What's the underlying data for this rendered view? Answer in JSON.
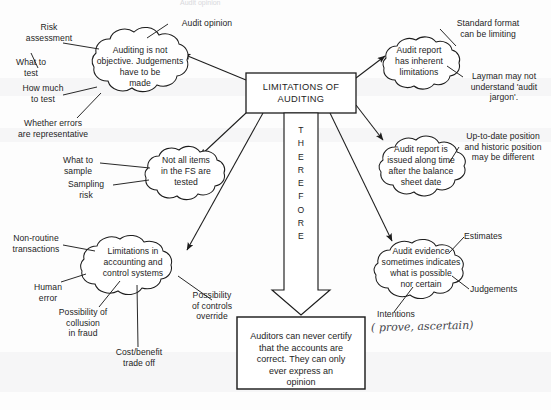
{
  "diagram": {
    "title_box": {
      "text": "LIMITATIONS OF\nAUDITING"
    },
    "therefore_arrow": {
      "letters": "T\nH\nE\nR\nE\nF\nO\nR\nE"
    },
    "conclusion_box": {
      "text": "Auditors can never certify\nthat the accounts are\ncorrect. They can only\never express an\nopinion"
    },
    "clouds": [
      {
        "id": "cloud-auditing-not-objective",
        "text": "Auditing is not\nobjective. Judgements\nhave to be\nmade"
      },
      {
        "id": "cloud-not-all-items-tested",
        "text": "Not all items\nin the FS are\ntested"
      },
      {
        "id": "cloud-limitations-accounting-controls",
        "text": "Limitations in\naccounting and\ncontrol systems"
      },
      {
        "id": "cloud-audit-report-inherent-limitations",
        "text": "Audit report\nhas inherent\nlimitations"
      },
      {
        "id": "cloud-audit-report-issued-late",
        "text": "Audit report is\nissued along time\nafter the balance\nsheet date"
      },
      {
        "id": "cloud-audit-evidence-persuasive",
        "text": "Audit evidence\nsometimes indicates\nwhat is possible\nnor certain"
      }
    ],
    "labels": [
      {
        "id": "label-risk-assessment",
        "text": "Risk\nassessment"
      },
      {
        "id": "label-what-to-test",
        "text": "What to\ntest"
      },
      {
        "id": "label-how-much-to-test",
        "text": "How much\nto test"
      },
      {
        "id": "label-whether-errors-representative",
        "text": "Whether errors\nare representative"
      },
      {
        "id": "label-audit-opinion",
        "text": "Audit opinion"
      },
      {
        "id": "label-what-to-sample",
        "text": "What to\nsample"
      },
      {
        "id": "label-sampling-risk",
        "text": "Sampling\nrisk"
      },
      {
        "id": "label-non-routine-transactions",
        "text": "Non-routine\ntransactions"
      },
      {
        "id": "label-human-error",
        "text": "Human\nerror"
      },
      {
        "id": "label-possibility-collusion-fraud",
        "text": "Possibility of\ncollusion\nin fraud"
      },
      {
        "id": "label-cost-benefit-trade-off",
        "text": "Cost/benefit\ntrade off"
      },
      {
        "id": "label-possibility-controls-override",
        "text": "Possibility\nof controls\noverride"
      },
      {
        "id": "label-standard-format-limiting",
        "text": "Standard format\ncan be limiting"
      },
      {
        "id": "label-layman-audit-jargon",
        "text": "Layman may not\nunderstand 'audit\njargon'."
      },
      {
        "id": "label-up-to-date-historic-position",
        "text": "Up-to-date position\nand historic position\nmay be different"
      },
      {
        "id": "label-estimates",
        "text": "Estimates"
      },
      {
        "id": "label-judgements",
        "text": "Judgements"
      },
      {
        "id": "label-intentions",
        "text": "Intentions"
      }
    ],
    "annotations": [
      {
        "id": "handwritten-prove-ascertain",
        "text": "( prove, ascertain)"
      }
    ],
    "cropped_header": {
      "text": "Audit opinion"
    }
  }
}
